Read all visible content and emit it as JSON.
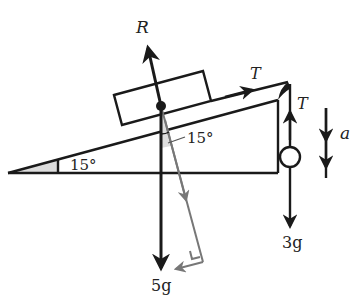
{
  "diagram": {
    "type": "physics-free-body-diagram",
    "colors": {
      "ink": "#1a1a1a",
      "component": "#777777",
      "shade": "#dddddd",
      "background": "#ffffff"
    },
    "labels": {
      "reaction": "R",
      "tension_block": "T",
      "tension_mass": "T",
      "acceleration": "a",
      "incline_angle": "15°",
      "component_angle": "15°",
      "block_weight": "5g",
      "mass_weight": "3g"
    }
  }
}
